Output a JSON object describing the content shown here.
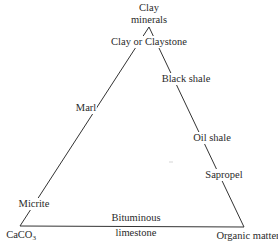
{
  "diagram": {
    "type": "ternary",
    "vertices": {
      "top": {
        "line1": "Clay",
        "line2": "minerals"
      },
      "bottom_left": {
        "text": "CaCO",
        "subscript": "3"
      },
      "bottom_right": {
        "text": "Organic matter"
      }
    },
    "edge_labels": {
      "left": [
        "Clay or Claystone",
        "Marl",
        "Micrite"
      ],
      "right": [
        "Black shale",
        "Oil shale",
        "Sapropel"
      ],
      "bottom": {
        "line1": "Bituminous",
        "line2": "limestone"
      }
    },
    "line_color": "#333333",
    "text_color": "#2a2a2a"
  }
}
